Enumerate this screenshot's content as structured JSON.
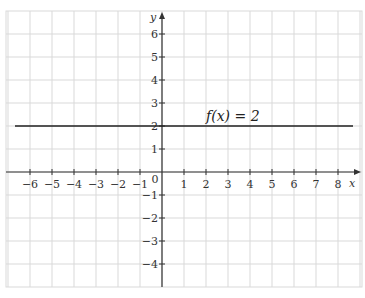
{
  "chart_data": {
    "type": "line",
    "title": "",
    "xlabel": "x",
    "ylabel": "y",
    "xlim": [
      -7,
      9
    ],
    "ylim": [
      -5,
      7
    ],
    "grid": true,
    "x_ticks": [
      "-6",
      "-5",
      "-4",
      "-3",
      "-2",
      "-1",
      "1",
      "2",
      "3",
      "4",
      "5",
      "6",
      "7",
      "8"
    ],
    "y_ticks": [
      "6",
      "5",
      "4",
      "3",
      "2",
      "1",
      "-1",
      "-2",
      "-3",
      "-4"
    ],
    "origin_label": "0",
    "series": [
      {
        "name": "f(x) = 2",
        "x": [
          -6.7,
          8.6
        ],
        "y": [
          2,
          2
        ]
      }
    ],
    "annotations": [
      {
        "text": "f(x) = 2",
        "x": 2,
        "y": 2.3
      }
    ],
    "colors": {
      "grid": "#d9d9d9",
      "axis": "#333333",
      "line": "#222222"
    }
  }
}
